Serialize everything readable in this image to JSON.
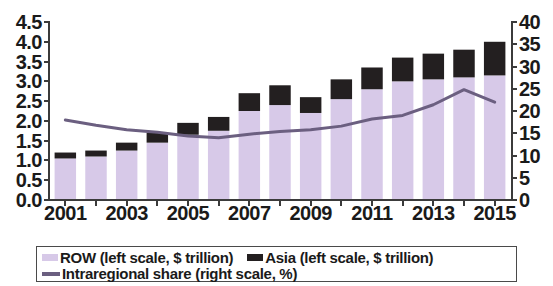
{
  "chart_data": {
    "type": "bar",
    "title": "",
    "subtitle": "",
    "xlabel": "",
    "ylabel": "",
    "grid": false,
    "legend_position": "bottom",
    "x": [
      2001,
      2002,
      2003,
      2004,
      2005,
      2006,
      2007,
      2008,
      2009,
      2010,
      2011,
      2012,
      2013,
      2014,
      2015
    ],
    "categories": [
      "2001",
      "2002",
      "2003",
      "2004",
      "2005",
      "2006",
      "2007",
      "2008",
      "2009",
      "2010",
      "2011",
      "2012",
      "2013",
      "2014",
      "2015"
    ],
    "x_tick_labels": [
      "2001",
      "2003",
      "2005",
      "2007",
      "2009",
      "2011",
      "2013",
      "2015"
    ],
    "left_axis": {
      "label": "",
      "ylim": [
        0.0,
        4.5
      ],
      "tick_step": 0.5,
      "ticks": [
        "0.0",
        "0.5",
        "1.0",
        "1.5",
        "2.0",
        "2.5",
        "3.0",
        "3.5",
        "4.0",
        "4.5"
      ],
      "unit": "$ trillion"
    },
    "right_axis": {
      "label": "",
      "ylim": [
        0,
        40
      ],
      "tick_step": 5,
      "ticks": [
        "0",
        "5",
        "10",
        "15",
        "20",
        "25",
        "30",
        "35",
        "40"
      ],
      "unit": "%"
    },
    "stacked": true,
    "series": [
      {
        "name": "ROW (left scale, $ trillion)",
        "type": "bar",
        "axis": "left",
        "color": "#d7c9e8",
        "values": [
          1.05,
          1.1,
          1.25,
          1.45,
          1.65,
          1.75,
          2.25,
          2.4,
          2.2,
          2.55,
          2.8,
          3.0,
          3.05,
          3.1,
          3.15
        ]
      },
      {
        "name": "Asia (left scale, $ trillion)",
        "type": "bar",
        "axis": "left",
        "color": "#231f20",
        "values": [
          0.15,
          0.15,
          0.2,
          0.25,
          0.3,
          0.35,
          0.45,
          0.5,
          0.4,
          0.5,
          0.55,
          0.6,
          0.65,
          0.7,
          0.85
        ]
      },
      {
        "name": "Intraregional share (right scale, %)",
        "type": "line",
        "axis": "right",
        "color": "#6b5f80",
        "values": [
          18.0,
          16.8,
          15.8,
          15.2,
          14.4,
          14.0,
          14.8,
          15.4,
          15.8,
          16.6,
          18.2,
          19.0,
          21.4,
          24.8,
          22.0
        ]
      }
    ],
    "totals": [
      1.2,
      1.25,
      1.45,
      1.7,
      1.95,
      2.1,
      2.7,
      2.9,
      2.6,
      3.05,
      3.35,
      3.6,
      3.7,
      3.8,
      4.0
    ]
  },
  "legend": {
    "entries": [
      {
        "label": "ROW (left scale, $ trillion)",
        "marker": "square-swatch",
        "color": "#d7c9e8"
      },
      {
        "label": "Asia (left scale, $ trillion)",
        "marker": "square-swatch",
        "color": "#231f20"
      },
      {
        "label": "Intraregional share (right scale, %)",
        "marker": "line-swatch",
        "color": "#6b5f80"
      }
    ]
  },
  "colors": {
    "row_bar": "#d7c9e8",
    "asia_bar": "#231f20",
    "line": "#6b5f80",
    "axis": "#3b3b3b",
    "text": "#1a1a1a",
    "background": "#ffffff"
  }
}
